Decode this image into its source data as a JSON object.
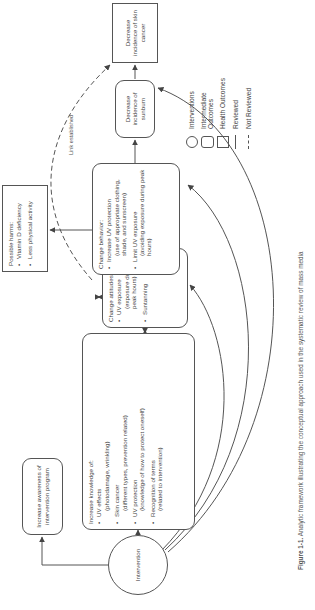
{
  "diagram": {
    "orientation": "rotated 90 degrees counter-clockwise",
    "nodes": {
      "intervention": {
        "label": "Intervention",
        "type": "intervention"
      },
      "awareness": {
        "label": "Increase awareness of intervention program",
        "type": "intermediate"
      },
      "knowledge": {
        "title": "Increase knowledge of:",
        "items": [
          {
            "label": "UV effects",
            "detail": "(photodamage, wrinkling)"
          },
          {
            "label": "Skin cancer",
            "detail": "(different types, prevention related)"
          },
          {
            "label": "UV protection",
            "detail": "(knowledge of how to protect oneself)"
          },
          {
            "label": "Recognition of terms",
            "detail": "(related to intervention)"
          }
        ],
        "type": "intermediate"
      },
      "attitudes": {
        "title": "Change attitudes about:",
        "items": [
          {
            "label": "UV exposure",
            "detail": "(exposure during peak hours)"
          },
          {
            "label": "Suntanning",
            "detail": ""
          }
        ],
        "type": "intermediate"
      },
      "behavior": {
        "title": "Change behavior:",
        "items": [
          {
            "label": "Increase UV protection",
            "detail": "(use of appropriate clothing, shade, and sunscreen)"
          },
          {
            "label": "Limit UV exposure",
            "detail": "(avoiding exposure during peak hours)"
          }
        ],
        "type": "intermediate"
      },
      "harms": {
        "title": "Possible harms:",
        "items": [
          {
            "label": "Vitamin D deficiency"
          },
          {
            "label": "Less physical activity"
          }
        ],
        "type": "health"
      },
      "sunburn": {
        "label": "Decrease incidence of sunburn",
        "type": "intermediate"
      },
      "skin_cancer": {
        "label": "Decrease incidence of skin cancer",
        "type": "health"
      }
    },
    "edges": [
      {
        "from": "intervention",
        "to": "awareness",
        "style": "solid"
      },
      {
        "from": "intervention",
        "to": "knowledge",
        "style": "solid"
      },
      {
        "from": "knowledge",
        "to": "attitudes",
        "style": "solid",
        "bidirectional": true
      },
      {
        "from": "attitudes",
        "to": "behavior",
        "style": "solid",
        "bidirectional": true
      },
      {
        "from": "behavior",
        "to": "sunburn",
        "style": "solid"
      },
      {
        "from": "sunburn",
        "to": "skin_cancer",
        "style": "solid"
      },
      {
        "from": "behavior",
        "to": "harms",
        "style": "solid"
      },
      {
        "from": "behavior",
        "to": "skin_cancer",
        "style": "dashed",
        "label": "Link established"
      },
      {
        "from": "intervention",
        "to": "attitudes",
        "style": "solid",
        "curved": true
      },
      {
        "from": "intervention",
        "to": "behavior",
        "style": "solid",
        "curved": true
      },
      {
        "from": "intervention",
        "to": "sunburn",
        "style": "solid",
        "curved": true
      }
    ],
    "edge_label": "Link established"
  },
  "legend": {
    "items": [
      {
        "symbol": "circle",
        "label": "Interventions"
      },
      {
        "symbol": "rounded-rect",
        "label": "Intermediate Outcomes"
      },
      {
        "symbol": "rect",
        "label": "Health Outcomes"
      },
      {
        "symbol": "solid-line",
        "label": "Reviewed"
      },
      {
        "symbol": "dashed-line",
        "label": "Not Reviewed"
      }
    ]
  },
  "caption": {
    "prefix": "Figure 1-1.",
    "text": "Analytic framework illustrating the conceptual approach used in the systematic review of mass media"
  },
  "colors": {
    "line": "#555555",
    "text": "#444444",
    "background": "#ffffff"
  }
}
